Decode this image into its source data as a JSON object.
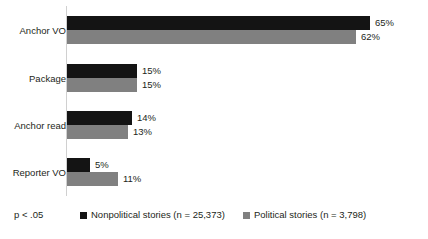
{
  "chart_data": {
    "type": "bar",
    "orientation": "horizontal",
    "title": "",
    "subtitle": "",
    "xlabel": "",
    "ylabel": "",
    "xlim": [
      0,
      70
    ],
    "grid": false,
    "legend_position": "bottom",
    "categories": [
      "Anchor VO",
      "Package",
      "Anchor read",
      "Reporter VO"
    ],
    "value_suffix": "%",
    "series": [
      {
        "name": "Nonpolitical stories (n = 25,373)",
        "short_name": "Nonpolitical stories",
        "n": "25,373",
        "color": "#141414",
        "values": [
          65,
          15,
          14,
          5
        ],
        "labels": [
          "65%",
          "15%",
          "14%",
          "5%"
        ]
      },
      {
        "name": "Political stories (n = 3,798)",
        "short_name": "Political stories",
        "n": "3,798",
        "color": "#808080",
        "values": [
          62,
          15,
          13,
          11
        ],
        "labels": [
          "62%",
          "15%",
          "13%",
          "11%"
        ]
      }
    ],
    "annotations": [
      {
        "id": "significance",
        "text": "p < .05"
      }
    ]
  },
  "footnote": {
    "significance": "p < .05"
  },
  "legend": {
    "items": [
      {
        "label": "Nonpolitical stories (n = 25,373)",
        "swatch": "black-square-icon"
      },
      {
        "label": "Political stories (n = 3,798)",
        "swatch": "gray-square-icon"
      }
    ]
  }
}
